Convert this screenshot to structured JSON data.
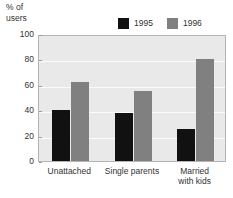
{
  "chart_data": {
    "type": "bar",
    "title": "",
    "subtitle": "",
    "xlabel": "",
    "ylabel": "% of\nusers",
    "categories": [
      "Unattached",
      "Single parents",
      "Married\nwith kids"
    ],
    "series": [
      {
        "name": "1995",
        "color": "#111111",
        "values": [
          40,
          38,
          25
        ]
      },
      {
        "name": "1996",
        "color": "#808080",
        "values": [
          62,
          55,
          80
        ]
      }
    ],
    "ylim": [
      0,
      100
    ],
    "yticks": [
      0,
      20,
      40,
      60,
      80,
      100
    ],
    "ytick_labels": [
      "0",
      "20",
      "40",
      "60",
      "80",
      "100"
    ],
    "grid": "horizontal",
    "grid_color": "#fbfbfb",
    "legend": {
      "position": "top-right",
      "entries": [
        {
          "label": "1995",
          "color": "#111111"
        },
        {
          "label": "1996",
          "color": "#808080"
        }
      ]
    },
    "plot_background": "#e9e9e9",
    "plot_border": "#b4b4b4",
    "text_color": "#333333"
  }
}
